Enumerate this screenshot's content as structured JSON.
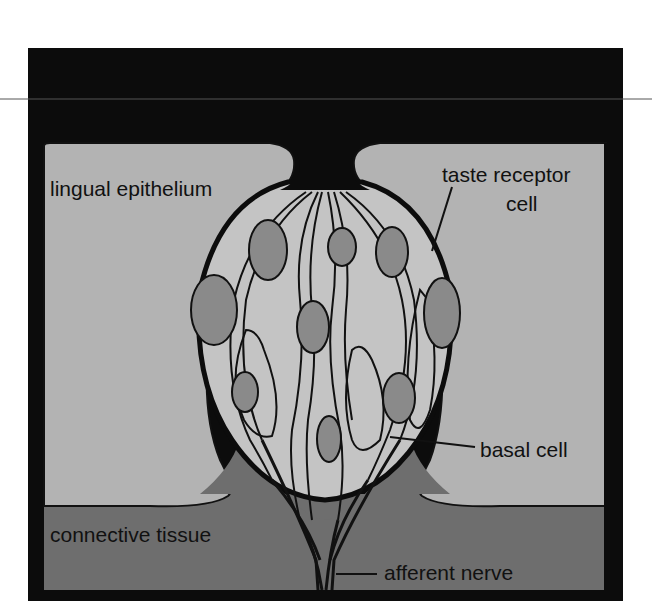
{
  "diagram": {
    "type": "anatomical illustration",
    "colors": {
      "frame": "#0c0c0c",
      "epithelium": "#b3b3b3",
      "connective_tissue": "#6e6e6e",
      "bud_interior": "#c4c4c4",
      "nucleus": "#8a8a8a",
      "outline": "#111111",
      "pore": "#0c0c0c"
    },
    "labels": {
      "epithelium": "lingual epithelium",
      "receptor_line1": "taste receptor",
      "receptor_line2": "cell",
      "basal": "basal cell",
      "connective": "connective tissue",
      "nerve": "afferent nerve"
    }
  }
}
